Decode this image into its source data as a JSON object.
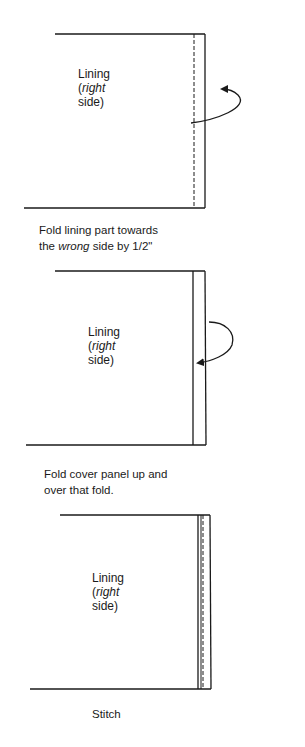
{
  "steps": [
    {
      "panel_label": {
        "line1": "Lining",
        "line2_open": "(",
        "line2_italic": "right",
        "line3": "side)"
      },
      "caption": {
        "line1": "Fold lining part towards",
        "line2_pre": "the ",
        "line2_italic": "wrong",
        "line2_post": " side by 1/2\""
      },
      "edge_style": "dashed fold line with folded strip",
      "arrow": "curved arrow fold-under"
    },
    {
      "panel_label": {
        "line1": "Lining",
        "line2_open": "(",
        "line2_italic": "right",
        "line3": "side)"
      },
      "caption": {
        "line1": "Fold cover panel up and",
        "line2": "over that fold."
      },
      "edge_style": "double solid edge",
      "arrow": "curved arrow fold-over"
    },
    {
      "panel_label": {
        "line1": "Lining",
        "line2_open": "(",
        "line2_italic": "right",
        "line3": "side)"
      },
      "caption": {
        "line1": "Stitch"
      },
      "edge_style": "triple edge with stitch line"
    }
  ],
  "colors": {
    "line": "#1a1a1a",
    "background": "#ffffff"
  }
}
